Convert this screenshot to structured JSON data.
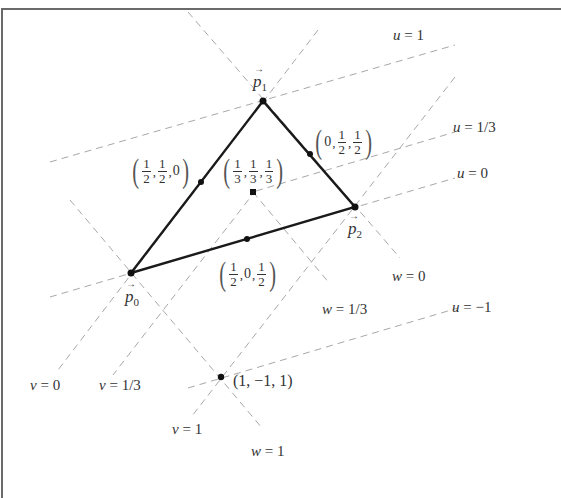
{
  "figure": {
    "vertices": [
      {
        "id": "p0",
        "label": "p",
        "sub": "0",
        "coords": [
          1,
          0,
          0
        ],
        "x": 131,
        "y": 273
      },
      {
        "id": "p1",
        "label": "p",
        "sub": "1",
        "coords": [
          0,
          1,
          0
        ],
        "x": 263,
        "y": 101
      },
      {
        "id": "p2",
        "label": "p",
        "sub": "2",
        "coords": [
          0,
          0,
          1
        ],
        "x": 355,
        "y": 207
      }
    ],
    "points": [
      {
        "name": "midpoint-p0-p1",
        "label": "(1/2, 1/2, 0)",
        "x": 201,
        "y": 182
      },
      {
        "name": "midpoint-p1-p2",
        "label": "(0, 1/2, 1/2)",
        "x": 310,
        "y": 154
      },
      {
        "name": "midpoint-p0-p2",
        "label": "(1/2, 0, 1/2)",
        "x": 247,
        "y": 239
      },
      {
        "name": "centroid",
        "label": "(1/3, 1/3, 1/3)",
        "x": 253,
        "y": 192
      },
      {
        "name": "outside-point",
        "label": "(1, −1, 1)",
        "x": 221,
        "y": 377
      }
    ],
    "isolines": [
      {
        "label": "u = 1",
        "var": "u",
        "value": "1"
      },
      {
        "label": "u = 1/3",
        "var": "u",
        "value": "1/3"
      },
      {
        "label": "u = 0",
        "var": "u",
        "value": "0"
      },
      {
        "label": "u = −1",
        "var": "u",
        "value": "−1"
      },
      {
        "label": "v = 0",
        "var": "v",
        "value": "0"
      },
      {
        "label": "v = 1/3",
        "var": "v",
        "value": "1/3"
      },
      {
        "label": "v = 1",
        "var": "v",
        "value": "1"
      },
      {
        "label": "w = 0",
        "var": "w",
        "value": "0"
      },
      {
        "label": "w = 1/3",
        "var": "w",
        "value": "1/3"
      },
      {
        "label": "w = 1",
        "var": "w",
        "value": "1"
      }
    ],
    "fractions": {
      "half_num": "1",
      "half_den": "2",
      "third_num": "1",
      "third_den": "3",
      "zero": "0"
    },
    "labels": {
      "u1_var": "u",
      "u1_rest": " = 1",
      "u13_var": "u",
      "u13_rest": " = 1/3",
      "u0_var": "u",
      "u0_rest": " = 0",
      "um1_var": "u",
      "um1_rest": " = −1",
      "v0_var": "v",
      "v0_rest": " = 0",
      "v13_var": "v",
      "v13_rest": " = 1/3",
      "v1_var": "v",
      "v1_rest": " = 1",
      "w0_var": "w",
      "w0_rest": " = 0",
      "w13_var": "w",
      "w13_rest": " = 1/3",
      "w1_var": "w",
      "w1_rest": " = 1",
      "outside_point": "(1, −1, 1)",
      "p_letter": "p",
      "p0_sub": "0",
      "p1_sub": "1",
      "p2_sub": "2",
      "arrow": "→"
    },
    "colors": {
      "triangle_edge": "#1a1a1a",
      "dashed_line": "#a8a8a8",
      "frame": "#6a6a6a",
      "text": "#333333"
    }
  }
}
